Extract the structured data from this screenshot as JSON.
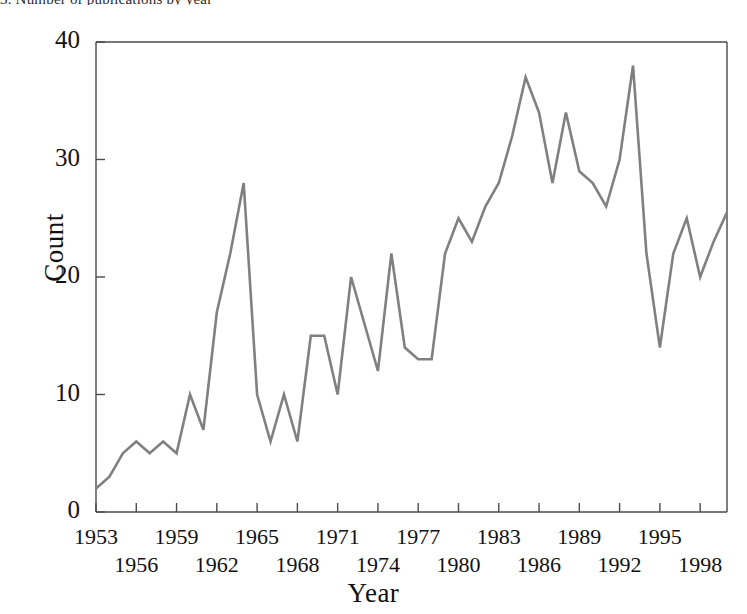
{
  "figure": {
    "top_cut_text": "3. Number of publications by year",
    "line_color": "#808080",
    "axis_color": "#4a4a4a",
    "background": "#ffffff"
  },
  "chart_data": {
    "type": "line",
    "title": "",
    "xlabel": "Year",
    "ylabel": "Count",
    "xlim": [
      1953,
      2000
    ],
    "ylim": [
      0,
      40
    ],
    "grid": false,
    "legend": null,
    "y_ticks": [
      0,
      10,
      20,
      30,
      40
    ],
    "x_ticks_upper": [
      1953,
      1959,
      1965,
      1971,
      1977,
      1983,
      1989,
      1995
    ],
    "x_ticks_lower": [
      1956,
      1962,
      1968,
      1974,
      1980,
      1986,
      1992,
      1998
    ],
    "x_tick_all": [
      1953,
      1956,
      1959,
      1962,
      1965,
      1968,
      1971,
      1974,
      1977,
      1980,
      1983,
      1986,
      1989,
      1992,
      1995,
      1998
    ],
    "x": [
      1953,
      1954,
      1955,
      1956,
      1957,
      1958,
      1959,
      1960,
      1961,
      1962,
      1963,
      1964,
      1965,
      1966,
      1967,
      1968,
      1969,
      1970,
      1971,
      1972,
      1973,
      1974,
      1975,
      1976,
      1977,
      1978,
      1979,
      1980,
      1981,
      1982,
      1983,
      1984,
      1985,
      1986,
      1987,
      1988,
      1989,
      1990,
      1991,
      1992,
      1993,
      1994,
      1995,
      1996,
      1997,
      1998,
      1999,
      2000
    ],
    "values": [
      2,
      3,
      5,
      6,
      5,
      6,
      5,
      10,
      7,
      17,
      22,
      28,
      10,
      6,
      10,
      6,
      15,
      15,
      10,
      20,
      16,
      12,
      22,
      14,
      13,
      13,
      22,
      25,
      23,
      26,
      28,
      32,
      37,
      34,
      28,
      34,
      29,
      28,
      26,
      30,
      38,
      22,
      14,
      22,
      25,
      20,
      23,
      25.5
    ],
    "series": [
      {
        "name": "Count",
        "color": "#808080",
        "values": [
          2,
          3,
          5,
          6,
          5,
          6,
          5,
          10,
          7,
          17,
          22,
          28,
          10,
          6,
          10,
          6,
          15,
          15,
          10,
          20,
          16,
          12,
          22,
          14,
          13,
          13,
          22,
          25,
          23,
          26,
          28,
          32,
          37,
          34,
          28,
          34,
          29,
          28,
          26,
          30,
          38,
          22,
          14,
          22,
          25,
          20,
          23,
          25.5
        ]
      }
    ],
    "annotations": {
      "first_peak": {
        "year": 1964,
        "value": 28
      },
      "max_peak": {
        "year": 1993,
        "value": 38
      },
      "secondary_peak": {
        "year": 1985,
        "value": 37
      },
      "post_peak_trough": {
        "year": 1995,
        "value": 14
      },
      "start": {
        "year": 1953,
        "value": 2
      }
    }
  }
}
